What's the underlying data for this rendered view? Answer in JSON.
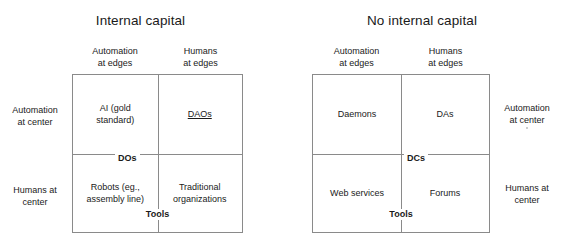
{
  "diagrams": [
    {
      "title": "Internal capital",
      "column_headers": [
        "Automation\nat edges",
        "Humans\nat edges"
      ],
      "row_labels": [
        "Automation\nat center",
        "Humans at\ncenter"
      ],
      "row_label_side": "left",
      "horizontal_axis_tag": "DOs",
      "vertical_axis_tag": "Tools",
      "cells": [
        {
          "text": "AI (gold\nstandard)",
          "underlined": false
        },
        {
          "text": "DAOs",
          "underlined": true
        },
        {
          "text": "Robots (eg.,\nassembly line)",
          "underlined": false
        },
        {
          "text": "Traditional\norganizations",
          "underlined": false
        }
      ]
    },
    {
      "title": "No internal capital",
      "column_headers": [
        "Automation\nat edges",
        "Humans\nat edges"
      ],
      "row_labels": [
        "Automation\nat center",
        "Humans at\ncenter"
      ],
      "row_label_side": "right",
      "horizontal_axis_tag": "DCs",
      "vertical_axis_tag": "Tools",
      "cells": [
        {
          "text": "Daemons",
          "underlined": false
        },
        {
          "text": "DAs",
          "underlined": false
        },
        {
          "text": "Web services",
          "underlined": false
        },
        {
          "text": "Forums",
          "underlined": false
        }
      ]
    }
  ],
  "colors": {
    "background": "#ffffff",
    "text": "#1a1a1a",
    "line": "#8a8a8a"
  }
}
